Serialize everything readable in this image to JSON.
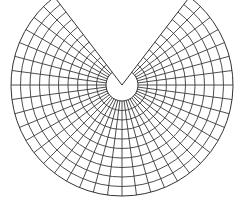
{
  "diagram": {
    "type": "polar-graticule",
    "sector_span_degrees": 285,
    "gap_degrees": 75,
    "gap_direction": "top",
    "spoke_interval_degrees": 7.5,
    "spoke_count": 39,
    "ring_count": 10,
    "has_inner_circle": true,
    "colors": {
      "line": "#3a3a3a",
      "background": "#ffffff"
    }
  }
}
